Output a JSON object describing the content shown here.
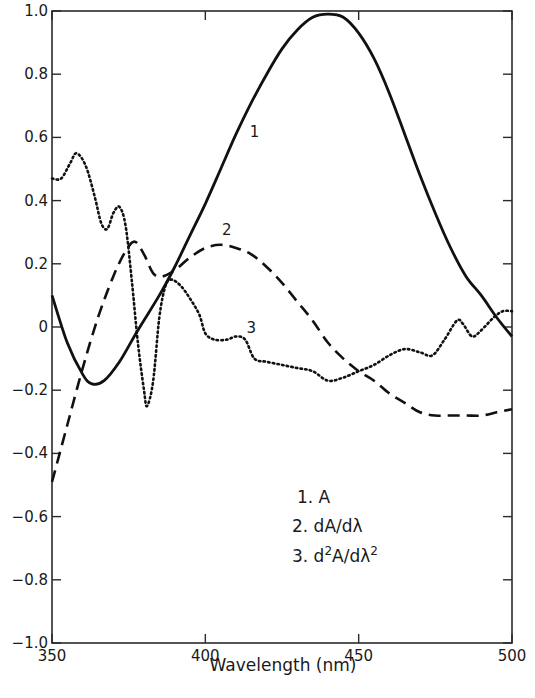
{
  "chart_data": {
    "type": "line",
    "title": "",
    "xlabel": "Wavelength (nm)",
    "ylabel": "",
    "xlim": [
      350,
      500
    ],
    "ylim": [
      -1.0,
      1.0
    ],
    "grid": false,
    "legend_position": "lower-right inside plot",
    "x_ticks": [
      350,
      400,
      450,
      500
    ],
    "x_tick_labels": [
      "350",
      "400",
      "450",
      "500"
    ],
    "y_ticks": [
      1.0,
      0.8,
      0.6,
      0.4,
      0.2,
      0,
      -0.2,
      -0.4,
      -0.6,
      -0.8,
      -1.0
    ],
    "y_tick_labels": [
      "1.0",
      "0.8",
      "0.6",
      "0.4",
      "0.2",
      "0",
      "-0.2",
      "-0.4",
      "-0.6",
      "-0.8",
      "-1.0"
    ],
    "series": [
      {
        "name": "1. A",
        "label": "1",
        "style": "solid",
        "points": [
          [
            350,
            0.1
          ],
          [
            355,
            -0.05
          ],
          [
            360,
            -0.15
          ],
          [
            363,
            -0.18
          ],
          [
            367,
            -0.17
          ],
          [
            372,
            -0.11
          ],
          [
            378,
            -0.01
          ],
          [
            385,
            0.1
          ],
          [
            390,
            0.19
          ],
          [
            395,
            0.29
          ],
          [
            400,
            0.39
          ],
          [
            405,
            0.5
          ],
          [
            410,
            0.61
          ],
          [
            415,
            0.71
          ],
          [
            420,
            0.8
          ],
          [
            425,
            0.88
          ],
          [
            430,
            0.94
          ],
          [
            435,
            0.98
          ],
          [
            440,
            0.99
          ],
          [
            445,
            0.98
          ],
          [
            450,
            0.93
          ],
          [
            455,
            0.85
          ],
          [
            460,
            0.74
          ],
          [
            465,
            0.61
          ],
          [
            470,
            0.48
          ],
          [
            475,
            0.36
          ],
          [
            480,
            0.25
          ],
          [
            485,
            0.16
          ],
          [
            490,
            0.1
          ],
          [
            495,
            0.03
          ],
          [
            500,
            -0.03
          ]
        ]
      },
      {
        "name": "2. dA/dλ",
        "label": "2",
        "style": "dashed",
        "points": [
          [
            350,
            -0.49
          ],
          [
            355,
            -0.31
          ],
          [
            360,
            -0.13
          ],
          [
            365,
            0.03
          ],
          [
            370,
            0.16
          ],
          [
            374,
            0.24
          ],
          [
            377,
            0.27
          ],
          [
            380,
            0.23
          ],
          [
            383,
            0.17
          ],
          [
            386,
            0.16
          ],
          [
            390,
            0.18
          ],
          [
            395,
            0.22
          ],
          [
            400,
            0.25
          ],
          [
            405,
            0.26
          ],
          [
            410,
            0.25
          ],
          [
            415,
            0.23
          ],
          [
            420,
            0.19
          ],
          [
            425,
            0.14
          ],
          [
            430,
            0.08
          ],
          [
            435,
            0.02
          ],
          [
            440,
            -0.05
          ],
          [
            445,
            -0.1
          ],
          [
            450,
            -0.14
          ],
          [
            455,
            -0.17
          ],
          [
            460,
            -0.21
          ],
          [
            465,
            -0.24
          ],
          [
            470,
            -0.27
          ],
          [
            475,
            -0.28
          ],
          [
            480,
            -0.28
          ],
          [
            485,
            -0.28
          ],
          [
            490,
            -0.28
          ],
          [
            495,
            -0.27
          ],
          [
            500,
            -0.26
          ]
        ]
      },
      {
        "name": "3. d²A/dλ²",
        "label": "3",
        "style": "dotted",
        "points": [
          [
            350,
            0.47
          ],
          [
            353,
            0.47
          ],
          [
            356,
            0.52
          ],
          [
            358,
            0.55
          ],
          [
            361,
            0.51
          ],
          [
            364,
            0.41
          ],
          [
            366,
            0.33
          ],
          [
            368,
            0.31
          ],
          [
            370,
            0.36
          ],
          [
            372,
            0.38
          ],
          [
            374,
            0.32
          ],
          [
            376,
            0.15
          ],
          [
            378,
            -0.05
          ],
          [
            380,
            -0.2
          ],
          [
            381,
            -0.25
          ],
          [
            383,
            -0.17
          ],
          [
            385,
            0.03
          ],
          [
            387,
            0.13
          ],
          [
            389,
            0.15
          ],
          [
            392,
            0.13
          ],
          [
            395,
            0.09
          ],
          [
            398,
            0.04
          ],
          [
            400,
            -0.02
          ],
          [
            403,
            -0.04
          ],
          [
            407,
            -0.04
          ],
          [
            410,
            -0.03
          ],
          [
            413,
            -0.04
          ],
          [
            416,
            -0.1
          ],
          [
            420,
            -0.11
          ],
          [
            425,
            -0.12
          ],
          [
            430,
            -0.13
          ],
          [
            435,
            -0.14
          ],
          [
            440,
            -0.17
          ],
          [
            445,
            -0.16
          ],
          [
            450,
            -0.14
          ],
          [
            455,
            -0.12
          ],
          [
            460,
            -0.09
          ],
          [
            465,
            -0.07
          ],
          [
            470,
            -0.08
          ],
          [
            474,
            -0.09
          ],
          [
            478,
            -0.04
          ],
          [
            482,
            0.02
          ],
          [
            484,
            0.01
          ],
          [
            487,
            -0.03
          ],
          [
            490,
            -0.01
          ],
          [
            494,
            0.03
          ],
          [
            497,
            0.05
          ],
          [
            500,
            0.05
          ]
        ]
      }
    ],
    "annotations": [
      {
        "text": "1",
        "near": [
          416,
          0.6
        ]
      },
      {
        "text": "2",
        "near": [
          407,
          0.29
        ]
      },
      {
        "text": "3",
        "near": [
          415,
          -0.02
        ]
      }
    ],
    "legend": [
      "1. A",
      "2. dA/dλ",
      "3. d²A/dλ²"
    ]
  },
  "legend": {
    "item1": "1. A",
    "item2_prefix": "2. dA/dλ",
    "item3_prefix": "3. d",
    "item3_sup1": "2",
    "item3_mid": "A/dλ",
    "item3_sup2": "2"
  },
  "axis": {
    "xlabel": "Wavelength (nm)"
  }
}
